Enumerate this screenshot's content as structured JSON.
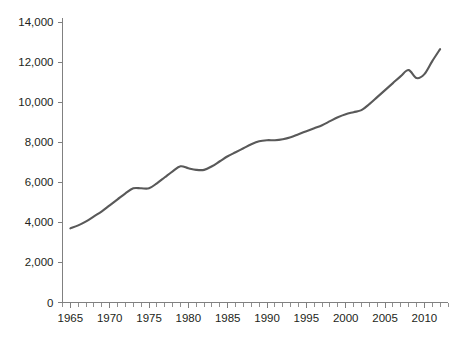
{
  "chart_data": {
    "type": "line",
    "title": "",
    "subtitle": "",
    "xlabel": "",
    "ylabel": "",
    "xlim": [
      1964,
      1913
    ],
    "ylim": [
      0,
      14000
    ],
    "grid": false,
    "legend": null,
    "annotations": [],
    "x_tick_labels": [
      "1965",
      "1970",
      "1975",
      "1980",
      "1985",
      "1990",
      "1995",
      "2000",
      "2005",
      "2010"
    ],
    "x_tick_values": [
      1965,
      1970,
      1975,
      1980,
      1985,
      1990,
      1995,
      2000,
      2005,
      2010
    ],
    "x_minor_tick_interval": 1,
    "y_tick_labels": [
      "0",
      "2,000",
      "4,000",
      "6,000",
      "8,000",
      "10,000",
      "12,000",
      "14,000"
    ],
    "y_tick_values": [
      0,
      2000,
      4000,
      6000,
      8000,
      10000,
      12000,
      14000
    ],
    "x_axis_start": 1964,
    "x_axis_end": 2013,
    "series": [
      {
        "name": "",
        "color": "#595959",
        "x": [
          1965,
          1966,
          1967,
          1968,
          1969,
          1970,
          1971,
          1972,
          1973,
          1974,
          1975,
          1976,
          1977,
          1978,
          1979,
          1980,
          1981,
          1982,
          1983,
          1984,
          1985,
          1986,
          1987,
          1988,
          1989,
          1990,
          1991,
          1992,
          1993,
          1994,
          1995,
          1996,
          1997,
          1998,
          1999,
          2000,
          2001,
          2002,
          2003,
          2004,
          2005,
          2006,
          2007,
          2008,
          2009,
          2010,
          2011,
          2012
        ],
        "values": [
          3700,
          3850,
          4050,
          4300,
          4550,
          4850,
          5150,
          5450,
          5700,
          5700,
          5700,
          5950,
          6250,
          6550,
          6800,
          6700,
          6620,
          6620,
          6800,
          7050,
          7300,
          7500,
          7700,
          7900,
          8050,
          8100,
          8100,
          8150,
          8250,
          8400,
          8550,
          8700,
          8850,
          9050,
          9250,
          9400,
          9500,
          9600,
          9900,
          10250,
          10600,
          10950,
          11300,
          11600,
          11200,
          11400,
          12050,
          12650
        ]
      }
    ]
  },
  "colors": {
    "line": "#595959",
    "axis": "#808080",
    "text": "#231f20",
    "background": "#ffffff"
  }
}
